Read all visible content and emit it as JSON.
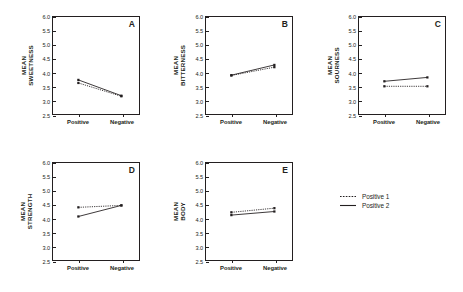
{
  "chart_data": {
    "type": "line",
    "title": "",
    "xlabel": "",
    "ylabel": "Mean rating",
    "categories": [
      "Positive",
      "Negative"
    ],
    "ylim": [
      2.5,
      6.0
    ],
    "ytick_labels": [
      "6.0",
      "5.5",
      "5.0",
      "4.5",
      "4.0",
      "3.5",
      "3.0",
      "2.5"
    ],
    "ytick_values": [
      6.0,
      5.5,
      5.0,
      4.5,
      4.0,
      3.5,
      3.0,
      2.5
    ],
    "grid": false,
    "legend_position": "bottom-right",
    "legend": [
      {
        "name": "Positive 1",
        "style": "dotted"
      },
      {
        "name": "Positive 2",
        "style": "solid"
      }
    ],
    "panels": [
      {
        "letter": "A",
        "ylabel_line1": "MEAN",
        "ylabel_line2": "SWEETNESS",
        "series": [
          {
            "name": "Positive 1",
            "style": "dotted",
            "values": [
              3.62,
              3.14
            ]
          },
          {
            "name": "Positive 2",
            "style": "solid",
            "values": [
              3.73,
              3.16
            ]
          }
        ]
      },
      {
        "letter": "B",
        "ylabel_line1": "MEAN",
        "ylabel_line2": "BITTERNESS",
        "series": [
          {
            "name": "Positive 1",
            "style": "dotted",
            "values": [
              3.89,
              4.19
            ]
          },
          {
            "name": "Positive 2",
            "style": "solid",
            "values": [
              3.9,
              4.27
            ]
          }
        ]
      },
      {
        "letter": "C",
        "ylabel_line1": "MEAN",
        "ylabel_line2": "SOURNESS",
        "series": [
          {
            "name": "Positive 1",
            "style": "dotted",
            "values": [
              3.5,
              3.5
            ]
          },
          {
            "name": "Positive 2",
            "style": "solid",
            "values": [
              3.68,
              3.82
            ]
          }
        ]
      },
      {
        "letter": "D",
        "ylabel_line1": "MEAN",
        "ylabel_line2": "STRENGTH",
        "series": [
          {
            "name": "Positive 1",
            "style": "dotted",
            "values": [
              4.4,
              4.47
            ]
          },
          {
            "name": "Positive 2",
            "style": "solid",
            "values": [
              4.07,
              4.47
            ]
          }
        ]
      },
      {
        "letter": "E",
        "ylabel_line1": "MEAN",
        "ylabel_line2": "BODY",
        "series": [
          {
            "name": "Positive 1",
            "style": "dotted",
            "values": [
              4.22,
              4.37
            ]
          },
          {
            "name": "Positive 2",
            "style": "solid",
            "values": [
              4.12,
              4.25
            ]
          }
        ]
      }
    ]
  }
}
